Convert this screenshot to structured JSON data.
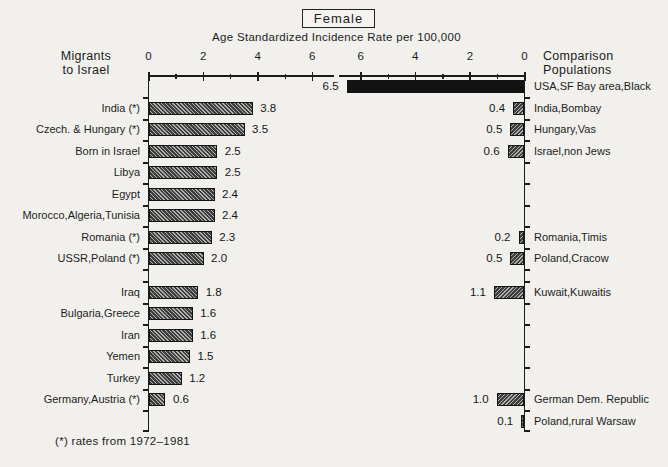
{
  "title": "Female",
  "subtitle": "Age Standardized Incidence Rate per 100,000",
  "left_axis_header": {
    "line1": "Migrants",
    "line2": "to Israel"
  },
  "right_axis_header": {
    "line1": "Comparison",
    "line2": "Populations"
  },
  "footnote": "(*) rates from 1972–1981",
  "chart_data": {
    "type": "bar",
    "layout": "mirrored-horizontal-bars",
    "title": "Female",
    "xlabel": "Age Standardized Incidence Rate per 100,000",
    "x_axis": {
      "major_ticks": [
        0,
        2,
        4,
        6
      ],
      "minor_ticks": [
        1,
        3,
        5
      ],
      "max": 6.9
    },
    "series": [
      {
        "name": "Migrants to Israel",
        "side": "left",
        "grows": "rightward"
      },
      {
        "name": "Comparison Populations",
        "side": "right",
        "grows": "leftward"
      }
    ],
    "rows": [
      {
        "right_label": "USA,SF Bay area,Black",
        "right_value": 6.5,
        "right_style": "solid"
      },
      {
        "left_label": "India (*)",
        "left_value": 3.8,
        "right_label": "India,Bombay",
        "right_value": 0.4
      },
      {
        "left_label": "Czech. & Hungary (*)",
        "left_value": 3.5,
        "right_label": "Hungary,Vas",
        "right_value": 0.5
      },
      {
        "left_label": "Born in Israel",
        "left_value": 2.5,
        "right_label": "Israel,non Jews",
        "right_value": 0.6
      },
      {
        "left_label": "Libya",
        "left_value": 2.5
      },
      {
        "left_label": "Egypt",
        "left_value": 2.4
      },
      {
        "left_label": "Morocco,Algeria,Tunisia",
        "left_value": 2.4
      },
      {
        "left_label": "Romania (*)",
        "left_value": 2.3,
        "right_label": "Romania,Timis",
        "right_value": 0.2
      },
      {
        "left_label": "USSR,Poland (*)",
        "left_value": 2.0,
        "right_label": "Poland,Cracow",
        "right_value": 0.5
      },
      {
        "left_label": "Iraq",
        "left_value": 1.8,
        "right_label": "Kuwait,Kuwaitis",
        "right_value": 1.1,
        "gap_before": true
      },
      {
        "left_label": "Bulgaria,Greece",
        "left_value": 1.6
      },
      {
        "left_label": "Iran",
        "left_value": 1.6
      },
      {
        "left_label": "Yemen",
        "left_value": 1.5
      },
      {
        "left_label": "Turkey",
        "left_value": 1.2
      },
      {
        "left_label": "Germany,Austria (*)",
        "left_value": 0.6,
        "right_label": "German Dem. Republic",
        "right_value": 1.0
      },
      {
        "right_label": "Poland,rural Warsaw",
        "right_value": 0.1
      }
    ]
  }
}
